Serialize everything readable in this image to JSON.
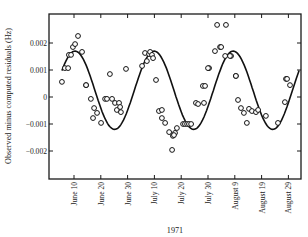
{
  "chart_data": {
    "type": "scatter",
    "title": "",
    "xlabel": "1971",
    "ylabel": "Observed minus computed residuals (Hz)",
    "x_units": "days after June 10, 1971",
    "xlim": [
      -9,
      84
    ],
    "ylim": [
      -0.0031,
      0.0031
    ],
    "grid": false,
    "legend": null,
    "x_ticks": [
      {
        "label": "June 10",
        "x": 0
      },
      {
        "label": "June 20",
        "x": 10
      },
      {
        "label": "June 30",
        "x": 20
      },
      {
        "label": "July 10",
        "x": 30
      },
      {
        "label": "July 20",
        "x": 40
      },
      {
        "label": "July 30",
        "x": 50
      },
      {
        "label": "August 9",
        "x": 60
      },
      {
        "label": "August 19",
        "x": 70
      },
      {
        "label": "August 29",
        "x": 80
      }
    ],
    "y_ticks": [
      {
        "label": "0.002",
        "y": 0.002
      },
      {
        "label": "0.001",
        "y": 0.001
      },
      {
        "label": "0",
        "y": 0
      },
      {
        "label": "−0.001",
        "y": -0.001
      },
      {
        "label": "−0.002",
        "y": -0.002
      }
    ],
    "series": [
      {
        "name": "Observed residuals",
        "kind": "points",
        "marker": "open-circle",
        "x": [
          -4.5,
          -3.4,
          -2.2,
          -1.9,
          -1.1,
          -0.4,
          0.4,
          1.5,
          3.0,
          4.5,
          4.5,
          6.3,
          7.1,
          7.5,
          8.6,
          10.1,
          11.6,
          12.3,
          13.4,
          14.2,
          15.3,
          16.0,
          16.8,
          17.2,
          17.5,
          19.4,
          25.4,
          26.5,
          27.2,
          28.0,
          28.4,
          29.1,
          29.5,
          30.6,
          31.7,
          32.8,
          32.8,
          34.0,
          35.5,
          36.9,
          37.7,
          38.4,
          37.3,
          36.6,
          40.7,
          41.4,
          42.2,
          42.9,
          43.7,
          45.5,
          46.3,
          48.5,
          48.1,
          48.9,
          50.4,
          50.0,
          52.6,
          54.5,
          54.9,
          56.4,
          53.4,
          56.7,
          58.6,
          58.2,
          60.4,
          60.4,
          61.2,
          62.3,
          63.4,
          64.5,
          65.3,
          66.4,
          67.9,
          68.7,
          71.6,
          76.1,
          78.7,
          79.1,
          79.5,
          80.6
        ],
        "y": [
          0.00056,
          0.00107,
          0.00107,
          0.00156,
          0.00156,
          0.00185,
          0.00196,
          0.00226,
          0.00167,
          0.00044,
          0.00044,
          -7e-05,
          -0.00078,
          -0.00041,
          -0.00059,
          -0.00096,
          -7e-05,
          -7e-05,
          0.00085,
          -7e-05,
          -0.00022,
          -0.00048,
          -0.00022,
          -0.00037,
          -0.00056,
          0.00104,
          0.00115,
          0.00163,
          0.00133,
          0.00159,
          0.00167,
          0.00156,
          0.00144,
          0.00063,
          -0.00052,
          -0.00048,
          -0.00078,
          -0.00096,
          -0.0013,
          -0.00144,
          -0.00133,
          -0.00115,
          -0.00141,
          -0.00196,
          -0.001,
          -0.001,
          -0.001,
          -0.001,
          -0.001,
          -0.00022,
          -0.00026,
          -0.00022,
          0.00041,
          0.00041,
          0.00107,
          0.00107,
          0.0017,
          0.00185,
          0.00185,
          0.00152,
          0.00267,
          0.00267,
          0.00152,
          0.00152,
          0.00078,
          0.00078,
          -0.00011,
          -0.00041,
          -0.00059,
          -0.00096,
          -0.00044,
          -0.00052,
          -0.00056,
          -0.00048,
          -0.0007,
          -0.00096,
          -0.00019,
          0.00067,
          0.00067,
          0.00044
        ]
      },
      {
        "name": "Fitted sinusoid",
        "kind": "line",
        "amplitude": 0.00145,
        "offset": 0.00025,
        "period_days": 29.5,
        "peak_day": 0.4,
        "x_range": [
          -4.5,
          84
        ]
      }
    ]
  }
}
